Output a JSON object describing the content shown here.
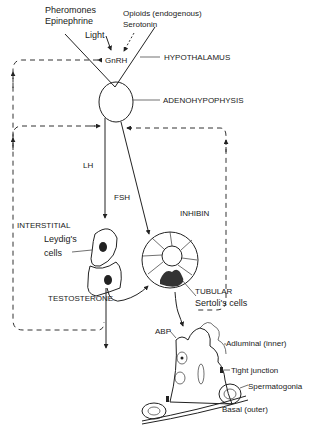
{
  "inputs": {
    "left_line1": "Pheromones",
    "left_line2": "Epinephrine",
    "light": "Light",
    "right_line1": "Opioids (endogenous)",
    "right_line2": "Serotonin"
  },
  "nodes": {
    "gnrh": "GnRH",
    "hypothalamus": "HYPOTHALAMUS",
    "adenohypophysis": "ADENOHYPOPHYSIS",
    "lh": "LH",
    "fsh": "FSH",
    "inhibin": "INHIBIN",
    "interstitial": "INTERSTITIAL",
    "leydig_line1": "Leydig's",
    "leydig_line2": "cells",
    "testosterone": "TESTOSTERONE",
    "tubular": "TUBULAR",
    "sertoli": "Sertoli's cells",
    "abp": "ABP",
    "adluminal": "Adluminal (inner)",
    "tight_junction": "Tight junction",
    "spermatogonia": "Spermatogonia",
    "basal": "Basal (outer)"
  }
}
